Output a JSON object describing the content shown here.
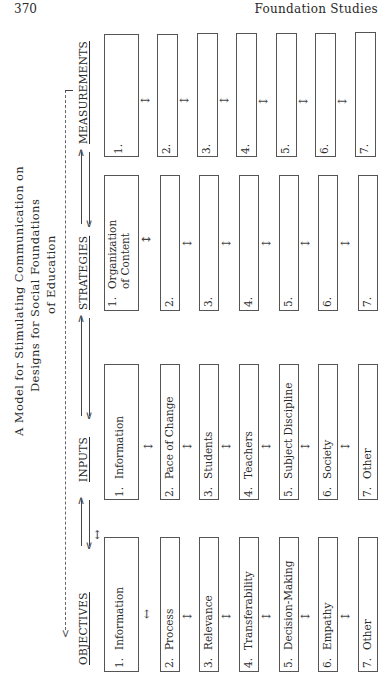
{
  "page": {
    "page_number": "370",
    "running_head": "Foundation Studies"
  },
  "diagram": {
    "title_lines": [
      "A Model for Stimulating Communication on",
      "Designs for Social Foundations",
      "of Education"
    ],
    "columns": [
      {
        "heading": "OBJECTIVES",
        "items": [
          {
            "num": "1.",
            "label": "Information"
          },
          {
            "num": "2.",
            "label": "Process"
          },
          {
            "num": "3.",
            "label": "Relevance"
          },
          {
            "num": "4.",
            "label": "Transferability"
          },
          {
            "num": "5.",
            "label": "Decision-Making"
          },
          {
            "num": "6.",
            "label": "Empathy"
          },
          {
            "num": "7.",
            "label": "Other"
          }
        ]
      },
      {
        "heading": "INPUTS",
        "items": [
          {
            "num": "1.",
            "label": "Information"
          },
          {
            "num": "2.",
            "label": "Pace of Change"
          },
          {
            "num": "3.",
            "label": "Students"
          },
          {
            "num": "4.",
            "label": "Teachers"
          },
          {
            "num": "5.",
            "label": "Subject Discipline"
          },
          {
            "num": "6.",
            "label": "Society"
          },
          {
            "num": "7.",
            "label": "Other"
          }
        ]
      },
      {
        "heading": "STRATEGIES",
        "items": [
          {
            "num": "1.",
            "label": "Organization",
            "label2": "of Content"
          },
          {
            "num": "2.",
            "label": ""
          },
          {
            "num": "3.",
            "label": ""
          },
          {
            "num": "4.",
            "label": ""
          },
          {
            "num": "5.",
            "label": ""
          },
          {
            "num": "6.",
            "label": ""
          },
          {
            "num": "7.",
            "label": ""
          }
        ]
      },
      {
        "heading": "MEASUREMENTS",
        "items": [
          {
            "num": "1.",
            "label": ""
          },
          {
            "num": "2.",
            "label": ""
          },
          {
            "num": "3.",
            "label": ""
          },
          {
            "num": "4.",
            "label": ""
          },
          {
            "num": "5.",
            "label": ""
          },
          {
            "num": "6.",
            "label": ""
          },
          {
            "num": "7.",
            "label": ""
          }
        ]
      }
    ],
    "connector_icons": {
      "between_headings": "bidirectional-arrows",
      "between_boxes": "double-headed-arrow",
      "feedback_loop": "dashed-feedback-line"
    }
  }
}
